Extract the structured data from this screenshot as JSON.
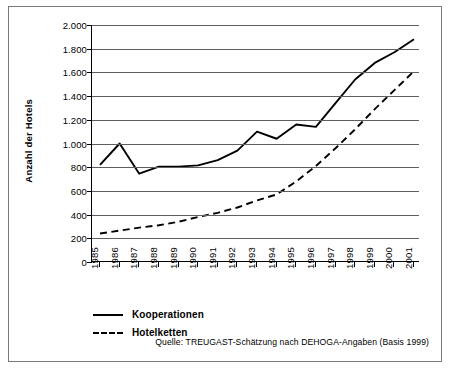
{
  "chart_data": {
    "type": "line",
    "title": "",
    "xlabel": "",
    "ylabel": "Anzahl der Hotels",
    "ylim": [
      0,
      2000
    ],
    "ytick_step": 200,
    "grid": true,
    "legend_position": "bottom-left",
    "categories": [
      "1985",
      "1986",
      "1987",
      "1988",
      "1989",
      "1990",
      "1991",
      "1992",
      "1993",
      "1994",
      "1995",
      "1996",
      "1997",
      "1998",
      "1999",
      "2000",
      "2001"
    ],
    "ytick_labels": [
      "0",
      "200",
      "400",
      "600",
      "800",
      "1.000",
      "1.200",
      "1.400",
      "1.600",
      "1.800",
      "2.000"
    ],
    "ytick_values": [
      0,
      200,
      400,
      600,
      800,
      1000,
      1200,
      1400,
      1600,
      1800,
      2000
    ],
    "series": [
      {
        "name": "Kooperationen",
        "style": "solid",
        "color": "#000000",
        "values": [
          820,
          1000,
          745,
          805,
          805,
          815,
          860,
          940,
          1100,
          1040,
          1160,
          1140,
          1340,
          1540,
          1680,
          1770,
          1880
        ]
      },
      {
        "name": "Hotelketten",
        "style": "dashed",
        "color": "#000000",
        "values": [
          240,
          265,
          290,
          310,
          340,
          380,
          415,
          460,
          520,
          570,
          680,
          810,
          960,
          1120,
          1290,
          1450,
          1610
        ]
      }
    ],
    "source_note": "Quelle: TREUGAST-Schätzung nach DEHOGA-Angaben (Basis 1999)"
  }
}
